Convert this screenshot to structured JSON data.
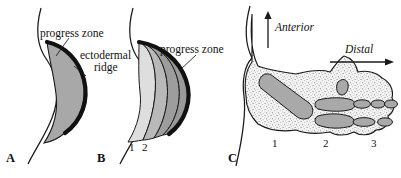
{
  "figure": {
    "background": "#ffffff",
    "ink": "#111111"
  },
  "panels": [
    {
      "id": "A",
      "letter": "A",
      "description": "Early limb bud with single progress zone and ectodermal ridge",
      "labels": [
        {
          "name": "progress-zone",
          "text": "progress zone"
        },
        {
          "name": "ectodermal-ridge-line1",
          "text": "ectodermal"
        },
        {
          "name": "ectodermal-ridge-line2",
          "text": "ridge"
        }
      ],
      "numbers": []
    },
    {
      "id": "B",
      "letter": "B",
      "description": "Later limb bud with successive zones laid down proximally",
      "labels": [
        {
          "name": "progress-zone",
          "text": "progress zone"
        }
      ],
      "numbers": [
        "1",
        "2"
      ]
    },
    {
      "id": "C",
      "letter": "C",
      "description": "Limb skeleton with proximodistal segments",
      "labels": [],
      "numbers": [
        "1",
        "2",
        "3"
      ]
    }
  ],
  "axes": [
    {
      "name": "anterior-axis",
      "text": "Anterior",
      "direction": "up"
    },
    {
      "name": "distal-axis",
      "text": "Distal",
      "direction": "right"
    }
  ],
  "colors": {
    "zone_light": "#dcdcdc",
    "zone_mid": "#b4b4b4",
    "zone_dark": "#9a9a9a",
    "ridge_black": "#121212",
    "bone_gray": "#a9a9a9",
    "stipple_fill": "#f2f2f2",
    "outline": "#1a1a1a"
  }
}
